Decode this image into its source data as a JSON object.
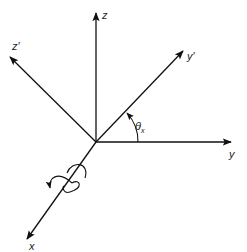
{
  "diagram": {
    "type": "coordinate-axes-rotation",
    "origin": [
      96,
      142
    ],
    "axes": [
      {
        "name": "z",
        "label": "z",
        "tip": [
          96,
          12
        ],
        "label_pos": [
          102,
          18
        ]
      },
      {
        "name": "z-prime",
        "label": "z′",
        "tip": [
          9,
          57
        ],
        "label_pos": [
          12,
          50
        ]
      },
      {
        "name": "y-prime",
        "label": "y′",
        "tip": [
          184,
          50
        ],
        "label_pos": [
          187,
          60
        ]
      },
      {
        "name": "y",
        "label": "y",
        "tip": [
          232,
          142
        ],
        "label_pos": [
          230,
          157
        ]
      },
      {
        "name": "x",
        "label": "x",
        "tip": [
          26,
          240
        ],
        "label_pos": [
          29,
          251
        ]
      }
    ],
    "angle": {
      "symbol": "θ",
      "subscript": "x",
      "label_pos": [
        137,
        130
      ]
    },
    "rotation_indicator": {
      "about_axis": "x",
      "direction": "counterclockwise"
    }
  }
}
